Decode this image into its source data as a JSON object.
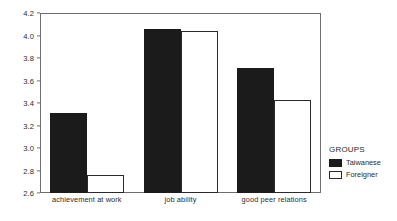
{
  "chart_data": {
    "type": "bar",
    "title": "",
    "subtitle": "",
    "xlabel": "",
    "ylabel": "",
    "categories": [
      "achievement at work",
      "job ability",
      "good peer relations"
    ],
    "series": [
      {
        "name": "Taiwanese",
        "values": [
          3.31,
          4.06,
          3.71
        ],
        "color": "#1b1b1b",
        "fill": "solid"
      },
      {
        "name": "Foreigner",
        "values": [
          2.76,
          4.04,
          3.43
        ],
        "color": "#ffffff",
        "fill": "outline"
      }
    ],
    "ylim": [
      2.6,
      4.2
    ],
    "yticks": [
      "2.6",
      "2.8",
      "3.0",
      "3.2",
      "3.4",
      "3.6",
      "3.8",
      "4.0",
      "4.2"
    ],
    "ytick_values": [
      2.6,
      2.8,
      3.0,
      3.2,
      3.4,
      3.6,
      3.8,
      4.0,
      4.2
    ],
    "grid": false,
    "legend_position": "right",
    "legend_title": "GROUPS"
  },
  "legend": {
    "title": "GROUPS",
    "entries": [
      {
        "label": "Taiwanese",
        "swatch": "filled-black-swatch"
      },
      {
        "label": "Foreigner",
        "swatch": "outline-white-swatch"
      }
    ]
  },
  "colors": {
    "series_taiwanese": "#1b1b1b",
    "series_foreigner": "#ffffff",
    "axis": "#6e6e6e",
    "text": "#2b2b2b",
    "background": "#ffffff"
  }
}
